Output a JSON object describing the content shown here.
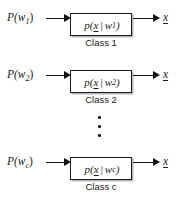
{
  "figure": {
    "background_color": "#ffffff",
    "line_color": "#111111"
  },
  "rows": [
    {
      "input_prior": "P(w",
      "input_prior_sub": "1",
      "input_prior_close": ")",
      "box_prefix": "p(",
      "box_variable": "x",
      "box_bar": "|",
      "box_condition": "w",
      "box_condition_sub": "1",
      "box_suffix": ")",
      "caption": "Class 1",
      "output": "x"
    },
    {
      "input_prior": "P(w",
      "input_prior_sub": "2",
      "input_prior_close": ")",
      "box_prefix": "p(",
      "box_variable": "x",
      "box_bar": "|",
      "box_condition": "w",
      "box_condition_sub": "2",
      "box_suffix": ")",
      "caption": "Class 2",
      "output": "x"
    },
    {
      "input_prior": "P(w",
      "input_prior_sub": "c",
      "input_prior_close": ")",
      "box_prefix": "p(",
      "box_variable": "x",
      "box_bar": "|",
      "box_condition": "w",
      "box_condition_sub": "c",
      "box_suffix": ")",
      "caption": "Class c",
      "output": "x"
    }
  ],
  "ellipsis": {
    "name": "vertical-ellipsis",
    "dot_count": 3
  }
}
